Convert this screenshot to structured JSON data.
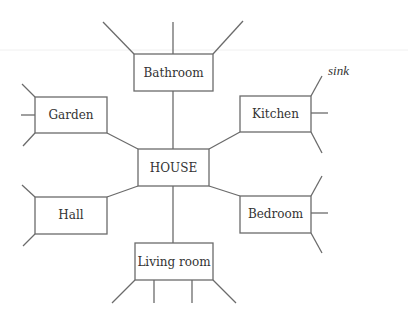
{
  "diagram": {
    "type": "spider-diagram",
    "center": {
      "id": "house",
      "label": "HOUSE"
    },
    "nodes": [
      {
        "id": "bathroom",
        "label": "Bathroom",
        "branch_count": 3
      },
      {
        "id": "garden",
        "label": "Garden",
        "branch_count": 3
      },
      {
        "id": "kitchen",
        "label": "Kitchen",
        "branch_count": 3
      },
      {
        "id": "hall",
        "label": "Hall",
        "branch_count": 2
      },
      {
        "id": "bedroom",
        "label": "Bedroom",
        "branch_count": 3
      },
      {
        "id": "living_room",
        "label": "Living room",
        "branch_count": 4
      }
    ],
    "annotations": [
      {
        "attached_to": "kitchen",
        "text": "sink"
      }
    ],
    "line_color": "#6b6b6b",
    "text_color": "#333333"
  }
}
